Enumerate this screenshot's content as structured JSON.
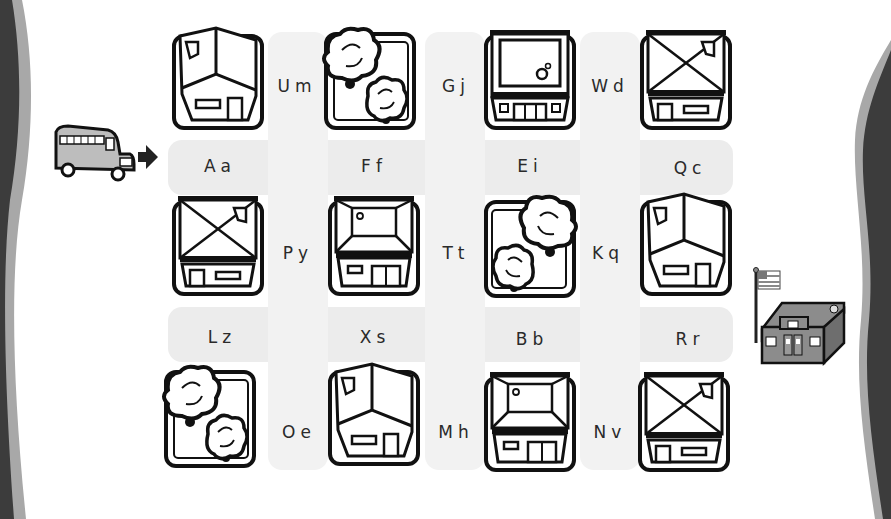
{
  "worksheet": {
    "type": "letter-maze",
    "start": {
      "label": "school-bus"
    },
    "goal": {
      "label": "school-building"
    },
    "colors": {
      "track": "#ececec",
      "ink": "#111111",
      "edge_dark": "#3c3c3c",
      "edge_light": "#a8a8a8"
    }
  },
  "grid": {
    "row_labels_between": [
      [
        "Um",
        "Gj",
        "Wd"
      ],
      [
        "Py",
        "Tt",
        "Kq"
      ],
      [
        "Oe",
        "Mh",
        "Nv"
      ]
    ],
    "column_labels_between": [
      [
        "Aa",
        "Ff",
        "Ei",
        "Qc"
      ],
      [
        "Lz",
        "Xs",
        "Bb",
        "Rr"
      ]
    ],
    "tiles": [
      [
        "house-angled",
        "trees",
        "house-flatroof",
        "house-x-roof"
      ],
      [
        "house-x-roof",
        "house-hip-roof",
        "trees",
        "house-angled"
      ],
      [
        "trees",
        "house-angled",
        "house-hip-roof",
        "house-x-roof"
      ]
    ]
  }
}
